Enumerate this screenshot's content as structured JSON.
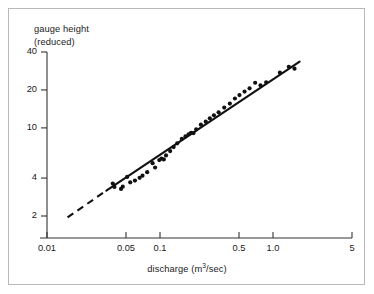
{
  "chart_data": {
    "type": "scatter",
    "title": "",
    "xlabel": "discharge (m³/sec)",
    "xlabel_parts": {
      "pre": "discharge (m",
      "sup": "3",
      "post": "/sec)"
    },
    "ylabel_line1": "gauge height",
    "ylabel_line2": "(reduced)",
    "xscale": "log",
    "yscale": "log",
    "xlim": [
      0.01,
      5
    ],
    "ylim": [
      1.55,
      48
    ],
    "grid": false,
    "legend": null,
    "xticks": [
      0.01,
      0.05,
      0.1,
      0.5,
      1.0,
      5
    ],
    "xticklabels": [
      "0.01",
      "0.05",
      "0.1",
      "0.5",
      "1.0",
      "5"
    ],
    "yticks": [
      2,
      4,
      10,
      20,
      40
    ],
    "yticklabels": [
      "2",
      "4",
      "10",
      "20",
      "40"
    ],
    "series": [
      {
        "name": "observations",
        "marker": "filled-circle",
        "color": "#111111",
        "marker_size_px": 4.2,
        "points": [
          [
            0.0382,
            3.62
          ],
          [
            0.0395,
            3.4
          ],
          [
            0.0452,
            3.28
          ],
          [
            0.0468,
            3.42
          ],
          [
            0.0512,
            4.08
          ],
          [
            0.0545,
            3.7
          ],
          [
            0.06,
            3.82
          ],
          [
            0.066,
            4.02
          ],
          [
            0.07,
            4.18
          ],
          [
            0.077,
            4.45
          ],
          [
            0.086,
            5.25
          ],
          [
            0.0905,
            4.85
          ],
          [
            0.0985,
            5.55
          ],
          [
            0.103,
            5.7
          ],
          [
            0.108,
            5.62
          ],
          [
            0.113,
            6.05
          ],
          [
            0.123,
            6.55
          ],
          [
            0.132,
            7.05
          ],
          [
            0.142,
            7.55
          ],
          [
            0.156,
            8.2
          ],
          [
            0.168,
            8.55
          ],
          [
            0.179,
            8.9
          ],
          [
            0.188,
            9.15
          ],
          [
            0.198,
            9.1
          ],
          [
            0.209,
            9.75
          ],
          [
            0.23,
            10.6
          ],
          [
            0.254,
            11.2
          ],
          [
            0.276,
            11.9
          ],
          [
            0.3,
            12.6
          ],
          [
            0.33,
            13.3
          ],
          [
            0.37,
            14.5
          ],
          [
            0.415,
            15.6
          ],
          [
            0.46,
            17.1
          ],
          [
            0.505,
            18.2
          ],
          [
            0.56,
            19.4
          ],
          [
            0.62,
            20.6
          ],
          [
            0.695,
            22.8
          ],
          [
            0.775,
            21.8
          ],
          [
            0.87,
            23.0
          ],
          [
            1.15,
            27.4
          ],
          [
            1.38,
            30.5
          ],
          [
            1.55,
            29.5
          ]
        ]
      }
    ],
    "fit_line": {
      "name": "rating-curve",
      "style_solid_from": [
        0.0335,
        3.18
      ],
      "style_solid_to": [
        1.72,
        33.6
      ],
      "style_dashed_from": [
        0.0152,
        1.95
      ],
      "style_dashed_to": [
        0.0335,
        3.18
      ],
      "color": "#111111"
    }
  },
  "annotations": {
    "frame_border_color": "#b9b9b9",
    "axis_color": "#333333",
    "background": "#ffffff"
  }
}
